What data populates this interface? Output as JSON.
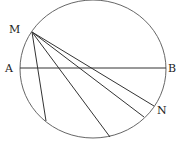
{
  "diagram": {
    "labels": {
      "M": "M",
      "A": "A",
      "B": "B",
      "N": "N"
    },
    "circle": {
      "cx": 93,
      "cy": 69,
      "rx": 73,
      "ry": 69
    },
    "point_M": [
      32,
      32
    ],
    "diameter_AB": [
      [
        20,
        68
      ],
      [
        166,
        68
      ]
    ],
    "chords_from_M": [
      [
        46,
        121
      ],
      [
        110,
        137
      ],
      [
        144,
        117
      ],
      [
        154,
        106
      ]
    ],
    "stroke_color": "#333333"
  }
}
